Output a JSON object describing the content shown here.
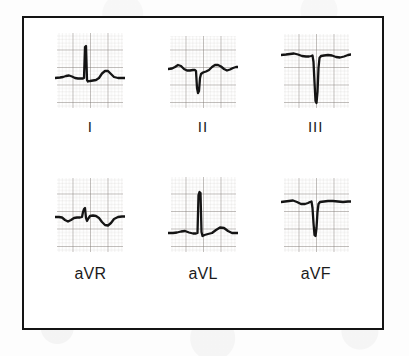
{
  "figure": {
    "caption": "",
    "frame_color": "#141414",
    "background_color": "#ffffff",
    "grid_minor_color": "#b9b2ad",
    "grid_major_color": "#6f6964",
    "trace_color": "#141414"
  },
  "leads": [
    {
      "id": "lead-i",
      "label": "I",
      "label_style": "roman",
      "morphology": "Small upright P wave, tall narrow positive R wave, upright T wave",
      "baseline_pct": 58,
      "qrs_polarity": "positive",
      "r_amplitude_pct": 46,
      "s_amplitude_pct": 6,
      "t_amplitude_pct": 12
    },
    {
      "id": "lead-ii",
      "label": "II",
      "label_style": "roman",
      "morphology": "Deep narrow QS complex, upward sloping ST with low upright T wave",
      "baseline_pct": 46,
      "qrs_polarity": "negative",
      "r_amplitude_pct": 0,
      "s_amplitude_pct": 30,
      "t_amplitude_pct": 8
    },
    {
      "id": "lead-iii",
      "label": "III",
      "label_style": "roman",
      "morphology": "Very deep narrow QS complex extending well below baseline, flat ST segment",
      "baseline_pct": 30,
      "qrs_polarity": "negative",
      "r_amplitude_pct": 0,
      "s_amplitude_pct": 62,
      "t_amplitude_pct": 4
    },
    {
      "id": "lead-avr",
      "label": "aVR",
      "label_style": "alpha",
      "morphology": "Small biphasic rS complex with inverted T wave dipping below baseline",
      "baseline_pct": 52,
      "qrs_polarity": "biphasic",
      "r_amplitude_pct": 10,
      "s_amplitude_pct": 8,
      "t_amplitude_pct": -12
    },
    {
      "id": "lead-avl",
      "label": "aVL",
      "label_style": "alpha",
      "morphology": "Tall narrow R wave rising from low baseline with small rounded upright T wave",
      "baseline_pct": 72,
      "qrs_polarity": "positive",
      "r_amplitude_pct": 58,
      "s_amplitude_pct": 4,
      "t_amplitude_pct": 10
    },
    {
      "id": "lead-avf",
      "label": "aVF",
      "label_style": "alpha",
      "morphology": "Deep narrow QS complex from a high flat baseline, flat ST segment",
      "baseline_pct": 32,
      "qrs_polarity": "negative",
      "r_amplitude_pct": 0,
      "s_amplitude_pct": 48,
      "t_amplitude_pct": 3
    }
  ]
}
